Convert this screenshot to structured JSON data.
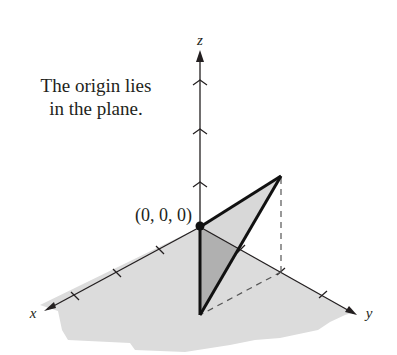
{
  "figure": {
    "caption_lines": [
      "The origin lies",
      "in the plane."
    ],
    "point_label": "(0, 0, 0)",
    "axes": {
      "x": "x",
      "y": "y",
      "z": "z"
    },
    "colors": {
      "plane": "#d9d9d9",
      "triangle_front": "#b3b3b3",
      "triangle_back": "#d4d4d4",
      "ink": "#231f20"
    }
  }
}
